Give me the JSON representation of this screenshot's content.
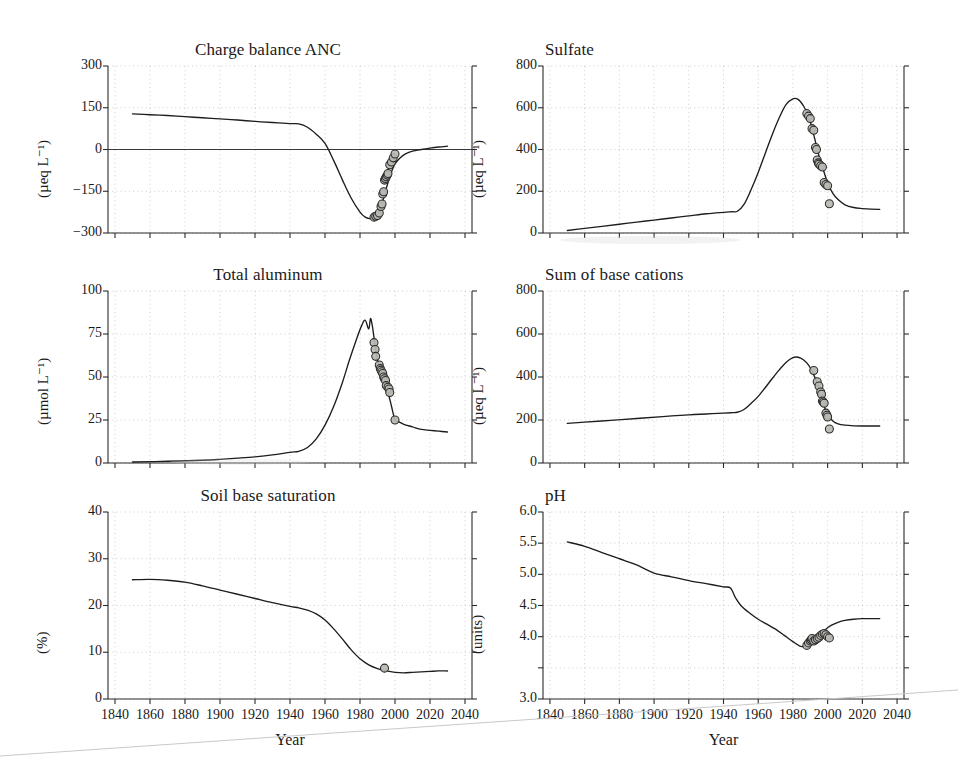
{
  "figure": {
    "background": "#ffffff",
    "line_color": "#1d1d1d",
    "marker_fill": "#b9b7b2",
    "marker_stroke": "#2b2b2b",
    "grid_color": "#b9b9b9"
  },
  "shared": {
    "xlabel": "Year",
    "xticks": [
      1840,
      1860,
      1880,
      1900,
      1920,
      1940,
      1960,
      1980,
      2000,
      2020,
      2040
    ],
    "xlim": [
      1836,
      2044
    ]
  },
  "chart_data": [
    {
      "id": "charge-balance-anc",
      "type": "line",
      "title": "Charge balance ANC",
      "xlabel": "Year",
      "ylabel": "(µeq L⁻¹)",
      "ylim": [
        -300,
        300
      ],
      "yticks": [
        -300,
        -150,
        0,
        150,
        300
      ],
      "ytick_labels": [
        "−300",
        "−150",
        "0",
        "150",
        "300"
      ],
      "grid": true,
      "zero_line": 0,
      "series": [
        {
          "name": "MAGIC simulation",
          "style": "line",
          "x": [
            1850,
            1860,
            1870,
            1880,
            1890,
            1900,
            1910,
            1920,
            1930,
            1940,
            1945,
            1950,
            1955,
            1960,
            1965,
            1970,
            1975,
            1980,
            1983,
            1986,
            1989,
            1992,
            1995,
            1998,
            2000,
            2003,
            2006,
            2010,
            2015,
            2020,
            2025,
            2030
          ],
          "y": [
            128,
            125,
            122,
            118,
            114,
            110,
            106,
            101,
            97,
            93,
            92,
            80,
            55,
            22,
            -40,
            -110,
            -175,
            -225,
            -243,
            -248,
            -240,
            -205,
            -140,
            -80,
            -52,
            -30,
            -16,
            -6,
            0,
            5,
            9,
            12
          ]
        },
        {
          "name": "Observed",
          "style": "markers",
          "x": [
            1988,
            1989,
            1990,
            1991,
            1992,
            1992.6,
            1993,
            1993.5,
            1994,
            1994.5,
            1995,
            1995.6,
            1996,
            1997,
            1998,
            1999,
            2000
          ],
          "y": [
            -243,
            -240,
            -237,
            -228,
            -205,
            -196,
            -160,
            -152,
            -110,
            -104,
            -98,
            -92,
            -86,
            -55,
            -45,
            -30,
            -16
          ]
        }
      ]
    },
    {
      "id": "sulfate",
      "type": "line",
      "title": "Sulfate",
      "xlabel": "Year",
      "ylabel": "(µeq L⁻¹)",
      "ylim": [
        0,
        800
      ],
      "yticks": [
        0,
        200,
        400,
        600,
        800
      ],
      "ytick_labels": [
        "0",
        "200",
        "400",
        "600",
        "800"
      ],
      "grid": true,
      "series": [
        {
          "name": "MAGIC simulation",
          "style": "line",
          "x": [
            1850,
            1860,
            1870,
            1880,
            1890,
            1900,
            1910,
            1920,
            1930,
            1940,
            1945,
            1948,
            1952,
            1956,
            1960,
            1964,
            1968,
            1972,
            1976,
            1980,
            1983,
            1986,
            1989,
            1992,
            1995,
            1998,
            2000,
            2003,
            2006,
            2010,
            2015,
            2020,
            2025,
            2030
          ],
          "y": [
            12,
            22,
            32,
            42,
            52,
            62,
            72,
            82,
            92,
            99,
            102,
            104,
            140,
            210,
            290,
            380,
            470,
            550,
            615,
            643,
            640,
            610,
            560,
            470,
            370,
            290,
            240,
            190,
            160,
            135,
            122,
            117,
            114,
            113
          ]
        },
        {
          "name": "Observed",
          "style": "markers",
          "x": [
            1988,
            1989,
            1990,
            1991,
            1992,
            1993,
            1993.6,
            1994,
            1994.6,
            1995,
            1996,
            1997,
            1998,
            1999,
            2000,
            2001
          ],
          "y": [
            572,
            560,
            548,
            500,
            492,
            410,
            400,
            350,
            336,
            330,
            322,
            316,
            242,
            232,
            226,
            140
          ]
        }
      ]
    },
    {
      "id": "total-aluminum",
      "type": "line",
      "title": "Total aluminum",
      "xlabel": "Year",
      "ylabel": "(µmol L⁻¹)",
      "ylim": [
        0,
        100
      ],
      "yticks": [
        0,
        25,
        50,
        75,
        100
      ],
      "ytick_labels": [
        "0",
        "25",
        "50",
        "75",
        "100"
      ],
      "grid": true,
      "series": [
        {
          "name": "MAGIC simulation",
          "style": "line",
          "x": [
            1850,
            1870,
            1890,
            1900,
            1910,
            1920,
            1930,
            1940,
            1945,
            1950,
            1955,
            1960,
            1965,
            1970,
            1974,
            1978,
            1981,
            1983,
            1985,
            1986,
            1987,
            1988,
            1989,
            1990,
            1992,
            1994,
            1996,
            1998,
            2000,
            2002,
            2005,
            2010,
            2015,
            2020,
            2025,
            2030
          ],
          "y": [
            0.6,
            1.0,
            1.6,
            2.1,
            2.8,
            3.6,
            4.7,
            6.2,
            6.8,
            9,
            14,
            22,
            33,
            47,
            60,
            72,
            80,
            83,
            78,
            84,
            80,
            73,
            66,
            60,
            53,
            46,
            41,
            33,
            25,
            24,
            22.5,
            21,
            19.5,
            19,
            18.5,
            18
          ]
        },
        {
          "name": "Observed",
          "style": "markers",
          "x": [
            1988,
            1988.6,
            1989,
            1991,
            1991.6,
            1992,
            1992.5,
            1993,
            1993.5,
            1994,
            1994.6,
            1995,
            1996,
            1996.6,
            1997,
            2000
          ],
          "y": [
            70,
            66,
            62,
            57,
            55,
            54,
            53,
            52,
            50,
            49,
            48,
            45,
            44,
            43,
            41,
            25
          ]
        }
      ]
    },
    {
      "id": "sum-of-base-cations",
      "type": "line",
      "title": "Sum of base cations",
      "xlabel": "Year",
      "ylabel": "(µeq L⁻¹)",
      "ylim": [
        0,
        800
      ],
      "yticks": [
        0,
        200,
        400,
        600,
        800
      ],
      "ytick_labels": [
        "0",
        "200",
        "400",
        "600",
        "800"
      ],
      "grid": true,
      "series": [
        {
          "name": "MAGIC simulation",
          "style": "line",
          "x": [
            1850,
            1860,
            1875,
            1890,
            1905,
            1920,
            1930,
            1940,
            1945,
            1948,
            1952,
            1956,
            1960,
            1964,
            1968,
            1972,
            1976,
            1980,
            1983,
            1986,
            1989,
            1992,
            1994,
            1996,
            1998,
            2000,
            2003,
            2006,
            2010,
            2015,
            2020,
            2025,
            2030
          ],
          "y": [
            184,
            190,
            198,
            207,
            216,
            224,
            228,
            232,
            234,
            236,
            250,
            278,
            310,
            350,
            392,
            432,
            468,
            490,
            492,
            480,
            455,
            410,
            370,
            320,
            265,
            225,
            195,
            182,
            176,
            173,
            172,
            172,
            172
          ]
        },
        {
          "name": "Observed",
          "style": "markers",
          "x": [
            1992,
            1994,
            1995,
            1996,
            1996.5,
            1997,
            1997.5,
            1998,
            1999,
            1999.6,
            2000,
            2001
          ],
          "y": [
            430,
            378,
            358,
            330,
            320,
            288,
            284,
            278,
            232,
            222,
            214,
            158
          ]
        }
      ]
    },
    {
      "id": "soil-base-saturation",
      "type": "line",
      "title": "Soil base saturation",
      "xlabel": "Year",
      "ylabel": "(%)",
      "ylim": [
        0,
        40
      ],
      "yticks": [
        0,
        10,
        20,
        30,
        40
      ],
      "ytick_labels": [
        "0",
        "10",
        "20",
        "30",
        "40"
      ],
      "grid": true,
      "series": [
        {
          "name": "MAGIC simulation",
          "style": "line",
          "x": [
            1850,
            1860,
            1870,
            1880,
            1890,
            1900,
            1910,
            1920,
            1930,
            1940,
            1945,
            1950,
            1955,
            1960,
            1965,
            1970,
            1975,
            1980,
            1985,
            1990,
            1995,
            2000,
            2005,
            2010,
            2015,
            2020,
            2025,
            2030
          ],
          "y": [
            25.5,
            25.6,
            25.4,
            25.0,
            24.2,
            23.3,
            22.4,
            21.5,
            20.6,
            19.8,
            19.5,
            19.0,
            18.2,
            16.9,
            15.0,
            12.8,
            10.5,
            8.6,
            7.3,
            6.5,
            6.0,
            5.7,
            5.6,
            5.7,
            5.8,
            5.9,
            6.0,
            6.0
          ]
        },
        {
          "name": "Observed",
          "style": "markers",
          "x": [
            1994
          ],
          "y": [
            6.6
          ]
        }
      ]
    },
    {
      "id": "ph",
      "type": "line",
      "title": "pH",
      "xlabel": "Year",
      "ylabel": "(units)",
      "ylim": [
        3.0,
        6.0
      ],
      "yticks": [
        3.0,
        3.5,
        4.0,
        4.5,
        5.0,
        5.5,
        6.0
      ],
      "ytick_labels": [
        "3.0",
        "3.5",
        "4.0",
        "4.5",
        "5.0",
        "5.5",
        "6.0"
      ],
      "ytick_labels_shown": [
        "3.0",
        "4.0",
        "4.5",
        "5.0",
        "5.5",
        "6.0"
      ],
      "grid": true,
      "series": [
        {
          "name": "MAGIC simulation",
          "style": "line",
          "x": [
            1850,
            1860,
            1870,
            1880,
            1890,
            1900,
            1910,
            1920,
            1930,
            1940,
            1944,
            1947,
            1950,
            1955,
            1960,
            1965,
            1970,
            1975,
            1980,
            1984,
            1987,
            1990,
            1993,
            1996,
            1999,
            2002,
            2006,
            2010,
            2015,
            2020,
            2025,
            2030
          ],
          "y": [
            5.52,
            5.45,
            5.35,
            5.25,
            5.15,
            5.02,
            4.96,
            4.9,
            4.85,
            4.8,
            4.78,
            4.62,
            4.5,
            4.38,
            4.28,
            4.2,
            4.12,
            4.02,
            3.92,
            3.85,
            3.84,
            3.86,
            3.92,
            4.02,
            4.12,
            4.18,
            4.23,
            4.26,
            4.28,
            4.29,
            4.29,
            4.29
          ]
        },
        {
          "name": "Observed",
          "style": "markers",
          "x": [
            1988,
            1989,
            1990,
            1990.6,
            1991,
            1992,
            1993,
            1994,
            1995,
            1996,
            1997,
            1998,
            1999,
            2000,
            2001
          ],
          "y": [
            3.86,
            3.9,
            3.93,
            3.95,
            3.97,
            3.93,
            3.95,
            3.97,
            3.99,
            4.02,
            4.04,
            4.05,
            4.03,
            4.0,
            3.98
          ]
        }
      ]
    }
  ]
}
